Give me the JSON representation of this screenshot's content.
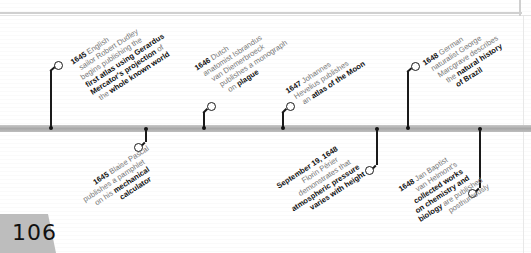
{
  "page": {
    "number": "106"
  },
  "events_above": [
    {
      "year": "1645",
      "lines": [
        {
          "parts": [
            {
              "b": "1645"
            },
            {
              "t": " English"
            }
          ]
        },
        {
          "parts": [
            {
              "t": "sailor Robert Dudley"
            }
          ]
        },
        {
          "parts": [
            {
              "t": "begins publishing the"
            }
          ]
        },
        {
          "parts": [
            {
              "b": "first atlas using Gerardus"
            }
          ]
        },
        {
          "parts": [
            {
              "b": "Mercator's projection"
            },
            {
              "t": " of"
            }
          ]
        },
        {
          "parts": [
            {
              "t": "the "
            },
            {
              "b": "whole known world"
            }
          ]
        }
      ],
      "text": "1645 English sailor Robert Dudley begins publishing the first atlas using Gerardus Mercator's projection of the whole known world"
    },
    {
      "year": "1646",
      "lines": [
        {
          "parts": [
            {
              "b": "1646"
            },
            {
              "t": " Dutch"
            }
          ]
        },
        {
          "parts": [
            {
              "t": "anatomist Isbrandus"
            }
          ]
        },
        {
          "parts": [
            {
              "t": "van Diemerbroeck"
            }
          ]
        },
        {
          "parts": [
            {
              "t": "publishes a monograph"
            }
          ]
        },
        {
          "parts": [
            {
              "t": "on "
            },
            {
              "b": "plague"
            }
          ]
        }
      ],
      "text": "1646 Dutch anatomist Isbrandus van Diemerbroeck publishes a monograph on plague"
    },
    {
      "year": "1647",
      "lines": [
        {
          "parts": [
            {
              "b": "1647"
            },
            {
              "t": " Johannes"
            }
          ]
        },
        {
          "parts": [
            {
              "t": "Hevelius publishes"
            }
          ]
        },
        {
          "parts": [
            {
              "t": "an "
            },
            {
              "b": "atlas of the Moon"
            }
          ]
        }
      ],
      "text": "1647 Johannes Hevelius publishes an atlas of the Moon"
    },
    {
      "year": "1648",
      "lines": [
        {
          "parts": [
            {
              "b": "1648"
            },
            {
              "t": " German"
            }
          ]
        },
        {
          "parts": [
            {
              "t": "naturalist George"
            }
          ]
        },
        {
          "parts": [
            {
              "t": "Marcgrave describes"
            }
          ]
        },
        {
          "parts": [
            {
              "t": "the "
            },
            {
              "b": "natural history"
            }
          ]
        },
        {
          "parts": [
            {
              "b": "of Brazil"
            }
          ]
        }
      ],
      "text": "1648 German naturalist George Marcgrave describes the natural history of Brazil"
    }
  ],
  "events_below": [
    {
      "year": "1645",
      "lines": [
        {
          "parts": [
            {
              "t": "Blaise Pascal"
            }
          ]
        },
        {
          "parts": [
            {
              "b": "1645"
            },
            {
              "t": " publishes a pamphlet"
            }
          ]
        },
        {
          "parts": [
            {
              "t": "on his "
            },
            {
              "b": "mechanical"
            }
          ]
        },
        {
          "parts": [
            {
              "b": "calculator"
            }
          ]
        }
      ],
      "text": "1645 Blaise Pascal publishes a pamphlet on his mechanical calculator"
    },
    {
      "year": "September 19, 1648",
      "lines": [
        {
          "parts": [
            {
              "b": "September 19, 1648"
            }
          ]
        },
        {
          "parts": [
            {
              "t": "Florin Périer"
            }
          ]
        },
        {
          "parts": [
            {
              "t": "demonstrates that"
            }
          ]
        },
        {
          "parts": [
            {
              "b": "atmospheric pressure"
            }
          ]
        },
        {
          "parts": [
            {
              "b": "varies with height"
            }
          ]
        }
      ],
      "text": "September 19, 1648 Florin Périer demonstrates that atmospheric pressure varies with height"
    },
    {
      "year": "1648",
      "lines": [
        {
          "parts": [
            {
              "b": "1648"
            },
            {
              "t": " Jan Baptist"
            }
          ]
        },
        {
          "parts": [
            {
              "t": "van Helmont's"
            }
          ]
        },
        {
          "parts": [
            {
              "b": "collected works"
            }
          ]
        },
        {
          "parts": [
            {
              "b": "on chemistry and"
            }
          ]
        },
        {
          "parts": [
            {
              "b": "biology"
            },
            {
              "t": " are published"
            }
          ]
        },
        {
          "parts": [
            {
              "t": "posthumously"
            }
          ]
        }
      ],
      "text": "1648 Jan Baptist van Helmont's collected works on chemistry and biology are published posthumously"
    }
  ],
  "colors": {
    "timeline": "#b0b0b0",
    "text_regular": "#777777",
    "text_bold": "#111111",
    "page_tab": "#bdbdbd"
  }
}
